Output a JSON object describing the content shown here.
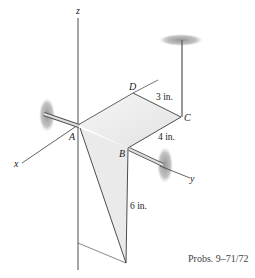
{
  "diagram": {
    "axes": {
      "x": "x",
      "y": "y",
      "z": "z"
    },
    "points": {
      "A": "A",
      "B": "B",
      "C": "C",
      "D": "D"
    },
    "dimensions": {
      "dc": "3 in.",
      "cb": "4 in.",
      "vertical": "6 in."
    },
    "caption": "Probs. 9–71/72",
    "colors": {
      "line": "#3a3a3a",
      "plate": "#ececec",
      "bearing": "#9a9a9a"
    }
  }
}
